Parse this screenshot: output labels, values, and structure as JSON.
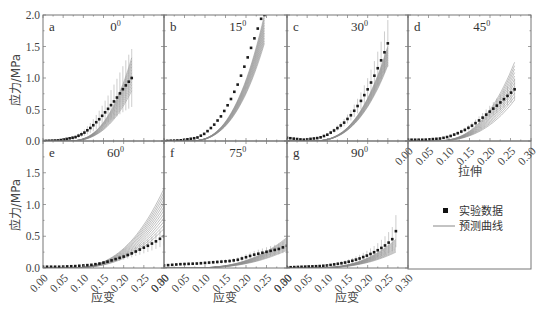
{
  "chart_data": {
    "type": "line",
    "layout": "2x4 panel grid (7 plot panels + legend box)",
    "shared_y": {
      "label": "应力/MPa",
      "ticks": [
        "0.0",
        "0.5",
        "1.0",
        "1.5",
        "2.0"
      ],
      "ylim": [
        0,
        2.0
      ]
    },
    "shared_x": {
      "label_bottom": "应变",
      "label_panel_d": "拉伸",
      "ticks": [
        "0.00",
        "0.05",
        "0.10",
        "0.15",
        "0.20",
        "0.25",
        "0.30"
      ],
      "xlim": [
        0,
        0.3
      ]
    },
    "legend": [
      {
        "marker": "square",
        "label": "实验数据"
      },
      {
        "marker": "line",
        "label": "预测曲线"
      }
    ],
    "panels": [
      {
        "id": "a",
        "angle": "0",
        "strain_max": 0.22,
        "experimental": {
          "x": [
            0.0,
            0.04,
            0.08,
            0.1,
            0.12,
            0.14,
            0.16,
            0.18,
            0.2,
            0.22
          ],
          "y": [
            0.0,
            0.01,
            0.06,
            0.12,
            0.22,
            0.35,
            0.5,
            0.66,
            0.84,
            1.0
          ]
        },
        "predicted_range": {
          "lower": 0.8,
          "upper": 1.32
        },
        "error_max": 1.5
      },
      {
        "id": "b",
        "angle": "15",
        "strain_max": 0.245,
        "experimental": {
          "x": [
            0.0,
            0.04,
            0.08,
            0.1,
            0.12,
            0.14,
            0.16,
            0.18,
            0.2,
            0.22,
            0.24
          ],
          "y": [
            0.0,
            0.01,
            0.05,
            0.12,
            0.24,
            0.4,
            0.62,
            0.9,
            1.25,
            1.62,
            2.0
          ]
        },
        "predicted_range": {
          "lower": 1.55,
          "upper": 2.0
        },
        "error_max": 2.0
      },
      {
        "id": "c",
        "angle": "30",
        "strain_max": 0.25,
        "experimental": {
          "x": [
            0.0,
            0.04,
            0.08,
            0.1,
            0.12,
            0.14,
            0.16,
            0.18,
            0.2,
            0.22,
            0.24,
            0.25
          ],
          "y": [
            0.05,
            0.02,
            0.05,
            0.1,
            0.18,
            0.28,
            0.42,
            0.6,
            0.82,
            1.08,
            1.38,
            1.55
          ]
        },
        "predicted_range": {
          "lower": 1.2,
          "upper": 1.5
        },
        "error_max": 1.95
      },
      {
        "id": "d",
        "angle": "45",
        "strain_max": 0.26,
        "experimental": {
          "x": [
            0.0,
            0.04,
            0.08,
            0.1,
            0.12,
            0.14,
            0.16,
            0.18,
            0.2,
            0.22,
            0.24,
            0.26
          ],
          "y": [
            0.02,
            0.02,
            0.04,
            0.07,
            0.12,
            0.18,
            0.26,
            0.36,
            0.47,
            0.58,
            0.7,
            0.82
          ]
        },
        "predicted_range": {
          "lower": 0.65,
          "upper": 1.25
        },
        "error_max": 1.0
      },
      {
        "id": "e",
        "angle": "60",
        "strain_max": 0.3,
        "experimental": {
          "x": [
            0.0,
            0.04,
            0.08,
            0.1,
            0.12,
            0.14,
            0.16,
            0.18,
            0.2,
            0.22,
            0.24,
            0.26,
            0.28,
            0.3
          ],
          "y": [
            0.02,
            0.02,
            0.03,
            0.04,
            0.05,
            0.07,
            0.1,
            0.14,
            0.18,
            0.23,
            0.29,
            0.35,
            0.42,
            0.5
          ]
        },
        "predicted_range": {
          "lower": 0.62,
          "upper": 1.25
        },
        "error_max": 0.65
      },
      {
        "id": "f",
        "angle": "75",
        "strain_max": 0.3,
        "experimental": {
          "x": [
            0.0,
            0.04,
            0.08,
            0.1,
            0.12,
            0.14,
            0.16,
            0.18,
            0.2,
            0.22,
            0.24,
            0.26,
            0.28,
            0.3
          ],
          "y": [
            0.04,
            0.06,
            0.07,
            0.08,
            0.09,
            0.1,
            0.11,
            0.13,
            0.17,
            0.21,
            0.24,
            0.27,
            0.3,
            0.35
          ]
        },
        "predicted_range": {
          "lower": 0.28,
          "upper": 0.48
        },
        "error_max": 0.45
      },
      {
        "id": "g",
        "angle": "90",
        "strain_max": 0.27,
        "experimental": {
          "x": [
            0.0,
            0.04,
            0.08,
            0.1,
            0.12,
            0.14,
            0.16,
            0.18,
            0.2,
            0.22,
            0.24,
            0.26,
            0.27
          ],
          "y": [
            0.01,
            0.02,
            0.03,
            0.04,
            0.06,
            0.08,
            0.11,
            0.15,
            0.2,
            0.26,
            0.34,
            0.44,
            0.58
          ]
        },
        "predicted_range": {
          "lower": 0.25,
          "upper": 0.45
        },
        "error_max": 0.85
      }
    ],
    "colors": {
      "data": "#1a1a1a",
      "prediction": "#8a8a8a",
      "error_bar": "#9a9a9a",
      "axis": "#777777"
    },
    "grid": false
  },
  "labels": {
    "y_title_top": "应力/MPa",
    "y_title_bottom": "应力/MPa",
    "x_title_bottom": "应变",
    "x_title_d": "拉伸",
    "legend_data": "实验数据",
    "legend_pred": "预测曲线",
    "angle_suffix": "0"
  }
}
